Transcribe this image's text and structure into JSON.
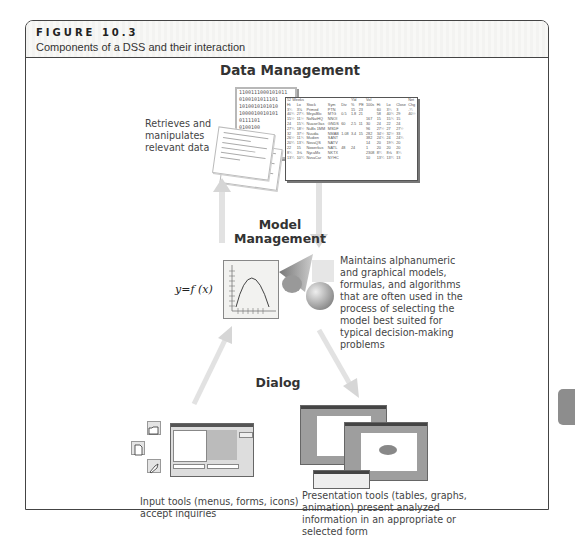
{
  "figure": {
    "label": "FIGURE 10.3",
    "caption": "Components of a DSS and their interaction"
  },
  "data_management": {
    "title": "Data Management",
    "description_lines": [
      "Retrieves and",
      "manipulates",
      "relevant data"
    ],
    "binary_lines": [
      "1100111000101011",
      "0100101011101",
      "1010010101010",
      "1000010010101",
      "0111101",
      "0100100"
    ],
    "stock_table": {
      "header1": [
        "52 Weeks",
        "",
        "",
        "",
        "",
        "Yld",
        "",
        "Vol",
        "",
        "",
        "",
        "Net"
      ],
      "header2": [
        "Hi",
        "Lo",
        "Stock",
        "Sym",
        "Div",
        "%",
        "PE",
        "100s",
        "Hi",
        "Lo",
        "Close",
        "Chg"
      ],
      "rows": [
        [
          "3¾",
          "3⅛",
          "Primed",
          "PTN",
          "",
          "15",
          "23",
          "",
          "60",
          "3¾",
          "3",
          "-¼"
        ],
        [
          "40¾",
          "27¾",
          "MeyaBlic",
          "MTG",
          "",
          "0.5",
          "1.8",
          "21",
          "58",
          "40¾",
          "29",
          "40½"
        ],
        [
          "15½",
          "11½",
          "NoNatHQ",
          "NNOI",
          "",
          "",
          "",
          "",
          "167",
          "15",
          "15¾",
          "15"
        ],
        [
          "24",
          "15¾",
          "NuaseGas",
          "GNDS",
          "",
          "60",
          "2.5",
          "11",
          "30",
          "24",
          "22",
          "24"
        ],
        [
          "27¾",
          "18½",
          "NuBs 1MM",
          "MSDF",
          "",
          "",
          "",
          "",
          "96",
          "27½",
          "27",
          "27½"
        ],
        [
          "32",
          "37½",
          "Nuudia",
          "NMAB",
          "1.08",
          "3.4",
          "15",
          "15",
          "282",
          "34½",
          "32½",
          "33"
        ],
        [
          "26½",
          "11¾",
          "Mudien",
          "SANT",
          "",
          "",
          "",
          "",
          "382",
          "24¾",
          "24",
          "24¾"
        ],
        [
          "20¼",
          "13¾",
          "NovaQS",
          "NATV",
          "",
          "",
          "",
          "",
          "14",
          "20",
          "19¾",
          "20"
        ],
        [
          "22",
          "15",
          "Nowerkus",
          "NATL",
          "",
          "48",
          "24",
          "",
          "1",
          "20",
          "20",
          "20"
        ],
        [
          "8¾",
          "3⅝",
          "NycaMx",
          "NKTX",
          "",
          "",
          "",
          "",
          "2308",
          "8¼",
          "8⅝",
          "8¾"
        ],
        [
          "13¼",
          "10¼",
          "NvsaCar",
          "NYHC",
          "",
          "",
          "",
          "",
          "10",
          "13¼",
          "13¼",
          "13"
        ]
      ]
    }
  },
  "model_management": {
    "title_line1": "Model",
    "title_line2": "Management",
    "formula": "y=f (x)",
    "description_lines": [
      "Maintains alphanumeric",
      "and graphical models,",
      "formulas, and algorithms",
      "that are often used in the",
      "process of selecting the",
      "model best suited for",
      "typical decision-making",
      "problems"
    ]
  },
  "dialog": {
    "title": "Dialog",
    "input_tools": {
      "icons": [
        "open-folder-icon",
        "new-document-icon",
        "paint-brush-icon"
      ],
      "description_lines": [
        "Input tools (menus, forms, icons)",
        "accept inquiries"
      ]
    },
    "presentation_tools": {
      "description_lines": [
        "Presentation tools (tables, graphs,",
        "animation) present analyzed",
        "information in an appropriate or",
        "selected form"
      ]
    }
  },
  "colors": {
    "frame_border": "#444444",
    "header_bg": "#f5f5f3",
    "arrow": "#d9d9d9",
    "side_tab": "#8d8d8d"
  }
}
